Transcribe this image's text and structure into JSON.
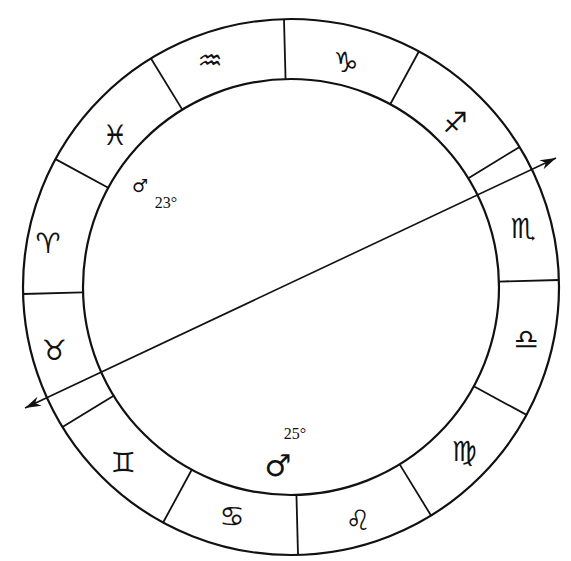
{
  "diagram": {
    "type": "zodiac-wheel",
    "signs": [
      {
        "name": "aquarius",
        "glyph": "♒",
        "x": 210,
        "y": 60
      },
      {
        "name": "capricorn",
        "glyph": "♑",
        "x": 346,
        "y": 62
      },
      {
        "name": "sagittarius",
        "glyph": "♐",
        "x": 455,
        "y": 122
      },
      {
        "name": "scorpio",
        "glyph": "♏",
        "x": 523,
        "y": 228
      },
      {
        "name": "libra",
        "glyph": "♎",
        "x": 526,
        "y": 339
      },
      {
        "name": "virgo",
        "glyph": "♍",
        "x": 464,
        "y": 451
      },
      {
        "name": "leo",
        "glyph": "♌",
        "x": 358,
        "y": 520
      },
      {
        "name": "cancer",
        "glyph": "♋",
        "x": 232,
        "y": 516
      },
      {
        "name": "gemini",
        "glyph": "♊",
        "x": 123,
        "y": 462
      },
      {
        "name": "taurus",
        "glyph": "♉",
        "x": 54,
        "y": 350
      },
      {
        "name": "aries",
        "glyph": "♈",
        "x": 48,
        "y": 243
      },
      {
        "name": "pisces",
        "glyph": "♓",
        "x": 115,
        "y": 135
      }
    ],
    "planets": [
      {
        "name": "uranus-or-mercury-symbol",
        "glyph": "♂",
        "degree": "23°",
        "x": 140,
        "y": 185,
        "deg_x": 166,
        "deg_y": 202,
        "size": 18
      },
      {
        "name": "mars",
        "glyph": "♂",
        "degree": "25°",
        "x": 278,
        "y": 465,
        "deg_x": 295,
        "deg_y": 433,
        "size": 30
      }
    ],
    "axis": {
      "label": "ecliptic-axis",
      "x1": 25,
      "y1": 408,
      "x2": 556,
      "y2": 158
    }
  }
}
